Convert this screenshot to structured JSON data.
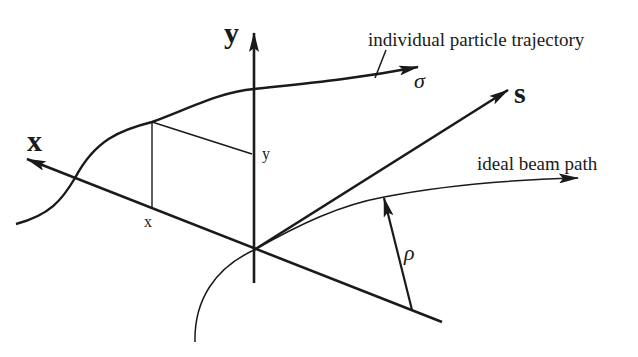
{
  "diagram": {
    "axes": {
      "x_label": "x",
      "y_label": "y",
      "s_label": "s"
    },
    "projections": {
      "x_label": "x",
      "y_label": "y"
    },
    "curves": {
      "trajectory_label": "individual particle trajectory",
      "trajectory_symbol": "σ",
      "beam_path_label": "ideal beam path",
      "radius_symbol": "ρ"
    },
    "colors": {
      "stroke": "#1a1a1a",
      "background": "#ffffff"
    }
  }
}
